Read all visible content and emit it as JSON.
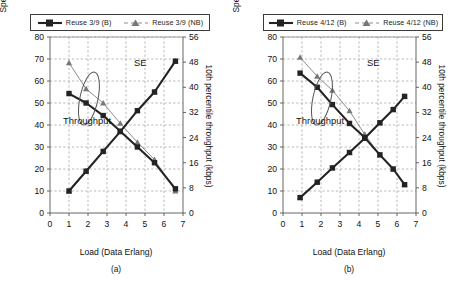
{
  "figure": {
    "panels": [
      {
        "id": "a",
        "caption": "(a)",
        "legend": [
          {
            "label": "Reuse 3/9 (B)",
            "style": "square-solid-black"
          },
          {
            "label": "Reuse 3/9 (NB)",
            "style": "triangle-dashed-gray"
          }
        ],
        "annotations": {
          "se": "SE",
          "throughput": "Throughput"
        },
        "chart_data": {
          "type": "line",
          "title": "",
          "xlabel": "Load (Data Erlang)",
          "ylabel": "Spectrum efficiency (kbps/cell/MHz)",
          "y2label": "10th percentile throughput (kbps)",
          "xlim": [
            0,
            7
          ],
          "ylim": [
            0,
            80
          ],
          "y2lim": [
            0,
            56
          ],
          "xticks": [
            0,
            1,
            2,
            3,
            4,
            5,
            6,
            7
          ],
          "yticks": [
            0,
            10,
            20,
            30,
            40,
            50,
            60,
            70,
            80
          ],
          "y2ticks": [
            0,
            8,
            16,
            24,
            32,
            40,
            48,
            56
          ],
          "grid": true,
          "legend_position": "top",
          "series": [
            {
              "name": "Reuse 3/9 (B) SE",
              "axis": "left",
              "marker": "square",
              "color": "#232323",
              "x": [
                1.0,
                1.9,
                2.8,
                3.7,
                4.6,
                5.5,
                6.6
              ],
              "values": [
                10,
                19,
                28,
                37,
                46.5,
                55,
                69
              ]
            },
            {
              "name": "Reuse 3/9 (NB) SE",
              "axis": "left",
              "marker": "triangle",
              "color": "#8d8d8d",
              "x": [
                1.0,
                1.9,
                2.8,
                3.7,
                4.6,
                5.5,
                6.6
              ],
              "values": [
                10,
                19,
                28,
                37,
                46.5,
                55,
                69
              ]
            },
            {
              "name": "Reuse 3/9 (B) Throughput",
              "axis": "right",
              "marker": "square",
              "color": "#232323",
              "x": [
                1.0,
                1.9,
                2.8,
                3.7,
                4.6,
                5.5,
                6.6
              ],
              "values": [
                38,
                35,
                31,
                26,
                21,
                16,
                7.7
              ]
            },
            {
              "name": "Reuse 3/9 (NB) Throughput",
              "axis": "right",
              "marker": "triangle",
              "color": "#8d8d8d",
              "x": [
                1.0,
                1.9,
                2.8,
                3.7,
                4.6,
                5.5,
                6.6
              ],
              "values": [
                47.8,
                39.5,
                35,
                28.5,
                22.5,
                17,
                7
              ]
            }
          ]
        }
      },
      {
        "id": "b",
        "caption": "(b)",
        "legend": [
          {
            "label": "Reuse 4/12 (B)",
            "style": "square-solid-black"
          },
          {
            "label": "Reuse 4/12 (NB)",
            "style": "triangle-dashed-gray"
          }
        ],
        "annotations": {
          "se": "SE",
          "throughput": "Throughput"
        },
        "chart_data": {
          "type": "line",
          "title": "",
          "xlabel": "Load (Data Erlang)",
          "ylabel": "Spectrum efficiency (kbps/cell/MHz)",
          "y2label": "10th percentile throughput (kbps)",
          "xlim": [
            0,
            7
          ],
          "ylim": [
            0,
            80
          ],
          "y2lim": [
            0,
            56
          ],
          "xticks": [
            0,
            1,
            2,
            3,
            4,
            5,
            6,
            7
          ],
          "yticks": [
            0,
            10,
            20,
            30,
            40,
            50,
            60,
            70,
            80
          ],
          "y2ticks": [
            0,
            8,
            16,
            24,
            32,
            40,
            48,
            56
          ],
          "grid": true,
          "legend_position": "top",
          "series": [
            {
              "name": "Reuse 4/12 (B) SE",
              "axis": "left",
              "marker": "square",
              "color": "#232323",
              "x": [
                0.9,
                1.8,
                2.6,
                3.5,
                4.3,
                5.1,
                5.8,
                6.4
              ],
              "values": [
                7,
                14,
                20.5,
                27.5,
                34,
                41,
                47,
                53
              ]
            },
            {
              "name": "Reuse 4/12 (NB) SE",
              "axis": "left",
              "marker": "triangle",
              "color": "#8d8d8d",
              "x": [
                0.9,
                1.8,
                2.6,
                3.5,
                4.3,
                5.1,
                5.8,
                6.4
              ],
              "values": [
                7,
                14,
                20.5,
                27.5,
                34,
                41,
                47,
                53
              ]
            },
            {
              "name": "Reuse 4/12 (B) Throughput",
              "axis": "right",
              "marker": "square",
              "color": "#232323",
              "x": [
                0.9,
                1.8,
                2.6,
                3.5,
                4.3,
                5.1,
                5.8,
                6.4
              ],
              "values": [
                44.5,
                40,
                34.5,
                28.5,
                24,
                18.5,
                14,
                9
              ]
            },
            {
              "name": "Reuse 4/12 (NB) Throughput",
              "axis": "right",
              "marker": "triangle",
              "color": "#8d8d8d",
              "x": [
                0.9,
                1.8,
                2.6,
                3.5,
                4.3,
                5.1,
                5.8,
                6.4
              ],
              "values": [
                49.5,
                43.5,
                39,
                32.5,
                25,
                18.5,
                14,
                9
              ]
            }
          ]
        }
      }
    ]
  }
}
